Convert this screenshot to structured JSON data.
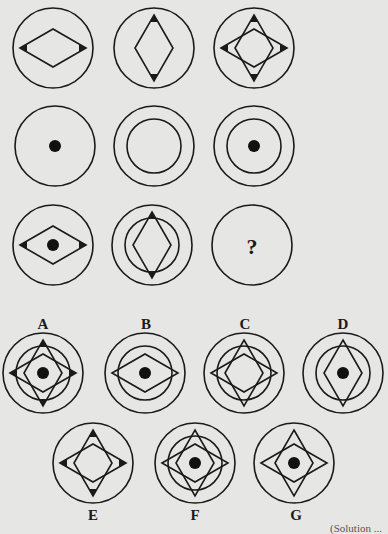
{
  "puzzle": {
    "type": "3x3 figure matrix with missing cell",
    "question_mark": "?",
    "grid": [
      {
        "row": 1,
        "cells": [
          "horizontal-diamond-with-side-arrowheads",
          "vertical-diamond-with-vertical-arrowheads",
          "both-diamonds-with-four-arrowheads"
        ]
      },
      {
        "row": 2,
        "cells": [
          "dot",
          "inner-circle",
          "inner-circle-with-dot"
        ]
      },
      {
        "row": 3,
        "cells": [
          "horizontal-diamond-arrowheads-with-dot",
          "vertical-diamond-arrowheads-with-inner-circle",
          "missing"
        ]
      }
    ],
    "options": [
      {
        "label": "A",
        "description": "both diamonds, four arrowheads, inner circle, dot"
      },
      {
        "label": "B",
        "description": "horizontal diamond, inner circle, dot, no arrowheads"
      },
      {
        "label": "C",
        "description": "both diamonds, inner circle, no arrowheads, no dot"
      },
      {
        "label": "D",
        "description": "vertical diamond, inner circle, dot, no arrowheads"
      },
      {
        "label": "E",
        "description": "both diamonds, four arrowheads, no inner circle, no dot"
      },
      {
        "label": "F",
        "description": "both diamonds, inner circle, dot, no arrowheads"
      },
      {
        "label": "G",
        "description": "both diamonds, dot, no inner circle, no arrowheads"
      }
    ],
    "footer_partial_text": "(Solution ..."
  },
  "colors": {
    "background": "#e6e6e4",
    "stroke": "#1a1a1a"
  }
}
